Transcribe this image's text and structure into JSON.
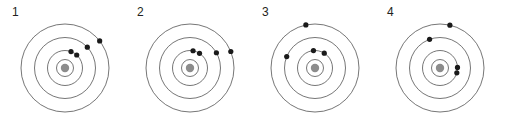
{
  "figure": {
    "background_color": "#ffffff",
    "ring_color": "#3b3b3b",
    "nucleus_color": "#8c8c8c",
    "electron_color": "#1a1a1a",
    "label_color": "#231f20"
  },
  "atoms": [
    {
      "label": "1",
      "offset_x": 0,
      "center": {
        "x": 65,
        "y": 68
      },
      "nucleus_radius": 4.2,
      "rings": [
        {
          "name": "innermost-ring",
          "radius": 8.5
        },
        {
          "name": "inner-ring",
          "radius": 17.5
        },
        {
          "name": "middle-ring",
          "radius": 30.5
        },
        {
          "name": "outer-ring",
          "radius": 44
        }
      ],
      "electrons": [
        {
          "name": "electron-inner-a",
          "ring": 1,
          "angle_deg": -70,
          "radius": 17.5
        },
        {
          "name": "electron-inner-b",
          "ring": 1,
          "angle_deg": -48,
          "radius": 17.5
        },
        {
          "name": "electron-middle",
          "ring": 2,
          "angle_deg": -43,
          "radius": 30.5
        },
        {
          "name": "electron-outer",
          "ring": 3,
          "angle_deg": -38,
          "radius": 44
        }
      ]
    },
    {
      "label": "2",
      "offset_x": 125,
      "center": {
        "x": 65,
        "y": 68
      },
      "nucleus_radius": 4.2,
      "rings": [
        {
          "name": "innermost-ring",
          "radius": 8.5
        },
        {
          "name": "inner-ring",
          "radius": 17.5
        },
        {
          "name": "middle-ring",
          "radius": 30.5
        },
        {
          "name": "outer-ring",
          "radius": 44
        }
      ],
      "electrons": [
        {
          "name": "electron-inner-a",
          "ring": 1,
          "angle_deg": -80,
          "radius": 17.5
        },
        {
          "name": "electron-inner-b",
          "ring": 1,
          "angle_deg": -57,
          "radius": 17.5
        },
        {
          "name": "electron-middle",
          "ring": 2,
          "angle_deg": -30,
          "radius": 30.5
        },
        {
          "name": "electron-outer",
          "ring": 3,
          "angle_deg": -22,
          "radius": 44
        }
      ]
    },
    {
      "label": "3",
      "offset_x": 250,
      "center": {
        "x": 65,
        "y": 68
      },
      "nucleus_radius": 4.2,
      "rings": [
        {
          "name": "innermost-ring",
          "radius": 8.5
        },
        {
          "name": "inner-ring",
          "radius": 17.5
        },
        {
          "name": "middle-ring",
          "radius": 30.5
        },
        {
          "name": "outer-ring",
          "radius": 44
        }
      ],
      "electrons": [
        {
          "name": "electron-inner-a",
          "ring": 1,
          "angle_deg": -95,
          "radius": 17.5
        },
        {
          "name": "electron-inner-b",
          "ring": 1,
          "angle_deg": -58,
          "radius": 17.5
        },
        {
          "name": "electron-middle",
          "ring": 2,
          "angle_deg": -158,
          "radius": 30.5
        },
        {
          "name": "electron-outer",
          "ring": 3,
          "angle_deg": -102,
          "radius": 44
        }
      ]
    },
    {
      "label": "4",
      "offset_x": 375,
      "center": {
        "x": 65,
        "y": 68
      },
      "nucleus_radius": 4.2,
      "rings": [
        {
          "name": "innermost-ring",
          "radius": 8.5
        },
        {
          "name": "inner-ring",
          "radius": 17.5
        },
        {
          "name": "middle-ring",
          "radius": 30.5
        },
        {
          "name": "outer-ring",
          "radius": 44
        }
      ],
      "electrons": [
        {
          "name": "electron-inner-a",
          "ring": 1,
          "angle_deg": -2,
          "radius": 17.5
        },
        {
          "name": "electron-inner-b",
          "ring": 1,
          "angle_deg": 16,
          "radius": 17.5
        },
        {
          "name": "electron-middle",
          "ring": 2,
          "angle_deg": -110,
          "radius": 30.5
        },
        {
          "name": "electron-outer",
          "ring": 3,
          "angle_deg": -77,
          "radius": 44
        }
      ]
    }
  ]
}
